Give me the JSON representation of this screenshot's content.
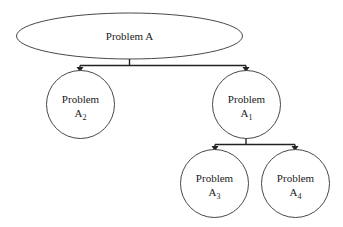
{
  "diagram": {
    "type": "problem-decomposition-tree",
    "nodes": {
      "root": {
        "label": "Problem A",
        "shape": "ellipse"
      },
      "a2": {
        "label": "Problem",
        "base": "A",
        "subscript": "2",
        "shape": "circle"
      },
      "a1": {
        "label": "Problem",
        "base": "A",
        "subscript": "1",
        "shape": "circle"
      },
      "a3": {
        "label": "Problem",
        "base": "A",
        "subscript": "3",
        "shape": "circle"
      },
      "a4": {
        "label": "Problem",
        "base": "A",
        "subscript": "4",
        "shape": "circle"
      }
    },
    "edges": [
      {
        "from": "Problem A",
        "to": "Problem A2"
      },
      {
        "from": "Problem A",
        "to": "Problem A1"
      },
      {
        "from": "Problem A1",
        "to": "Problem A3"
      },
      {
        "from": "Problem A1",
        "to": "Problem A4"
      }
    ]
  }
}
